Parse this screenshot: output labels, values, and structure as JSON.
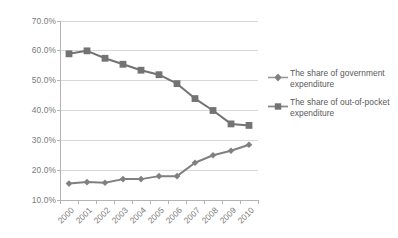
{
  "chart_data": {
    "type": "line",
    "title": "",
    "xlabel": "",
    "ylabel": "",
    "categories": [
      "2000",
      "2001",
      "2002",
      "2003",
      "2004",
      "2005",
      "2006",
      "2007",
      "2008",
      "2009",
      "2010"
    ],
    "ylim": [
      10,
      70
    ],
    "ytick_labels": [
      "10.0%",
      "20.0%",
      "30.0%",
      "40.0%",
      "50.0%",
      "60.0%",
      "70.0%"
    ],
    "ytick_values": [
      10,
      20,
      30,
      40,
      50,
      60,
      70
    ],
    "grid": "horizontal",
    "legend_position": "right",
    "series": [
      {
        "name": "The share of government expenditure",
        "marker": "diamond",
        "color": "#808080",
        "values": [
          15.5,
          16.0,
          15.8,
          17.0,
          17.0,
          18.0,
          18.0,
          22.5,
          25.0,
          26.5,
          28.5
        ]
      },
      {
        "name": "The share of out-of-pocket expenditure",
        "marker": "square",
        "color": "#737373",
        "values": [
          59.0,
          60.0,
          57.5,
          55.5,
          53.5,
          52.0,
          49.0,
          44.0,
          40.0,
          35.5,
          35.0
        ]
      }
    ]
  },
  "legend": {
    "entries": [
      {
        "label": "The share of government expenditure",
        "marker": "diamond-marker-icon"
      },
      {
        "label": "The share of out-of-pocket expenditure",
        "marker": "square-marker-icon"
      }
    ]
  },
  "colors": {
    "series_gray": "#808080",
    "grid": "#d4d4d4",
    "axis": "#b3b3b3",
    "text": "#7a7a7a",
    "background": "#ffffff"
  }
}
